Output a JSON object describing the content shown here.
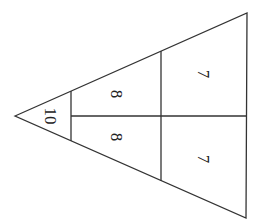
{
  "diagram": {
    "type": "triangle-number-pyramid",
    "orientation": "apex-left, rotated 90deg clockwise",
    "stroke_color": "#333333",
    "background": "#ffffff",
    "rows": [
      {
        "row": 1,
        "cells": [
          "10"
        ]
      },
      {
        "row": 2,
        "cells": [
          "8",
          "8"
        ]
      },
      {
        "row": 3,
        "cells": [
          "7",
          "7"
        ]
      }
    ],
    "labels": {
      "apex": "10",
      "row2_top": "8",
      "row2_bottom": "8",
      "row3_top": "7",
      "row3_bottom": "7"
    }
  }
}
